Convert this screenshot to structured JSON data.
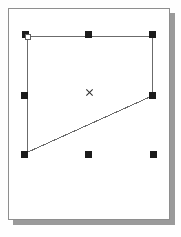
{
  "app": {
    "name": "vector-drawing-canvas",
    "canvas_width": 181,
    "canvas_height": 237,
    "background_color": "#fefefe"
  },
  "page": {
    "name": "document-page",
    "x": 8,
    "y": 8,
    "width": 162,
    "height": 212,
    "fill_color": "#ffffff",
    "border_color": "#8e8e8e",
    "shadow_color": "#9a9a9a",
    "shadow_offset": 5
  },
  "shape": {
    "name": "selected-quadrilateral",
    "type": "polygon",
    "stroke_color": "#6b6b6b",
    "stroke_width": 1,
    "fill": "none",
    "points": [
      {
        "label": "top-left-vertex",
        "x": 27,
        "y": 36
      },
      {
        "label": "top-right-vertex",
        "x": 152,
        "y": 36
      },
      {
        "label": "right-middle-vertex",
        "x": 152,
        "y": 96
      },
      {
        "label": "bottom-left-vertex",
        "x": 28,
        "y": 152
      }
    ],
    "points_path": "27,36 152,36 152,96 28,152 27,36"
  },
  "selection": {
    "name": "selection-handles",
    "handle_color": "#1b1b1b",
    "handle_size": 7,
    "handles": [
      {
        "label": "handle-top-left",
        "position": "top-left",
        "x": 22,
        "y": 31
      },
      {
        "label": "handle-top-center",
        "position": "top-center",
        "x": 85,
        "y": 31
      },
      {
        "label": "handle-top-right",
        "position": "top-right",
        "x": 149,
        "y": 31
      },
      {
        "label": "handle-middle-left",
        "position": "middle-left",
        "x": 21,
        "y": 92
      },
      {
        "label": "handle-middle-right",
        "position": "middle-right",
        "x": 149,
        "y": 92
      },
      {
        "label": "handle-bottom-left",
        "position": "bottom-left",
        "x": 21,
        "y": 151
      },
      {
        "label": "handle-bottom-center",
        "position": "bottom-center",
        "x": 85,
        "y": 151
      },
      {
        "label": "handle-bottom-right",
        "position": "bottom-right",
        "x": 150,
        "y": 151
      }
    ]
  },
  "anchor": {
    "name": "vertex-anchor-point",
    "x": 25,
    "y": 34,
    "fill_color": "#ffffff",
    "border_color": "#5d5d5d",
    "size": 6
  },
  "center": {
    "name": "rotation-center-marker",
    "glyph": "x",
    "x": 85,
    "y": 88,
    "color": "#2a2a2a",
    "size": 9
  }
}
